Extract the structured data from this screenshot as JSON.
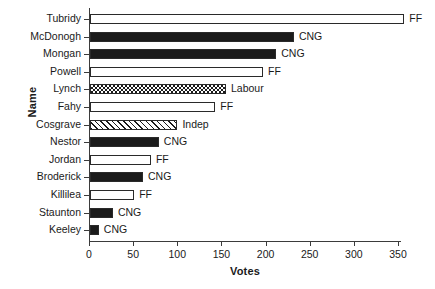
{
  "chart_data": {
    "type": "bar",
    "orientation": "horizontal",
    "title": "",
    "xlabel": "Votes",
    "ylabel": "Name",
    "xlim": [
      0,
      370
    ],
    "xticks": [
      0,
      50,
      100,
      150,
      200,
      250,
      300,
      350
    ],
    "grid": false,
    "legend": "none",
    "categories": [
      "Tubridy",
      "McDonogh",
      "Mongan",
      "Powell",
      "Lynch",
      "Fahy",
      "Cosgrave",
      "Nestor",
      "Jordan",
      "Broderick",
      "Killilea",
      "Staunton",
      "Keeley"
    ],
    "values": [
      356,
      231,
      211,
      196,
      154,
      142,
      99,
      78,
      69,
      60,
      50,
      26,
      10
    ],
    "annotations": [
      "FF",
      "CNG",
      "CNG",
      "FF",
      "Labour",
      "FF",
      "Indep",
      "CNG",
      "FF",
      "CNG",
      "FF",
      "CNG",
      "CNG"
    ],
    "fills": [
      "hollow",
      "solid",
      "solid",
      "hollow",
      "check",
      "hollow",
      "diag",
      "solid",
      "hollow",
      "solid",
      "hollow",
      "solid",
      "solid"
    ],
    "colors": {
      "solid": "#1b1b1b",
      "hollow": "#ffffff",
      "outline": "#2a2a2a",
      "axis": "#3b3b3b",
      "text": "#1a1a1a"
    }
  }
}
